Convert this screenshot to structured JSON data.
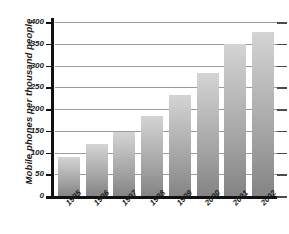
{
  "chart_data": {
    "type": "bar",
    "title": "",
    "xlabel": "",
    "ylabel": "Mobile phones per thousand people",
    "categories": [
      "1995",
      "1996",
      "1997",
      "1998",
      "1999",
      "2000",
      "2001",
      "2002"
    ],
    "values": [
      90,
      120,
      148,
      183,
      233,
      283,
      350,
      377
    ],
    "ylim": [
      0,
      400
    ],
    "yticks": [
      0,
      50,
      100,
      150,
      200,
      250,
      300,
      350,
      400
    ],
    "ytick_labels": [
      "0",
      "50",
      "100",
      "150",
      "200",
      "250",
      "300",
      "350",
      "400"
    ],
    "grid": true,
    "legend": null,
    "series": [
      {
        "name": "Mobile phones per thousand people",
        "values": [
          90,
          120,
          148,
          183,
          233,
          283,
          350,
          377
        ]
      }
    ],
    "colors": {
      "bar_top": "#d4d4d4",
      "bar_bottom": "#848484",
      "gridline": "#9a9a9a",
      "axis": "#111111",
      "text": "#1a1a1a",
      "background": "#ffffff"
    }
  }
}
